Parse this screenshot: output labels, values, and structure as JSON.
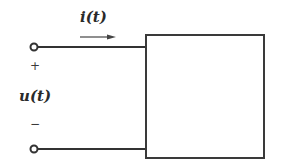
{
  "diagram": {
    "type": "one-port network",
    "labels": {
      "current": "i(t)",
      "voltage": "u(t)",
      "plus": "+",
      "minus": "−"
    },
    "colors": {
      "stroke": "#333333",
      "text": "#2a2a2a",
      "background": "#ffffff"
    },
    "elements": {
      "terminals": [
        "top terminal (+)",
        "bottom terminal (−)"
      ],
      "box": "network block",
      "arrow": "current direction arrow pointing right"
    }
  }
}
